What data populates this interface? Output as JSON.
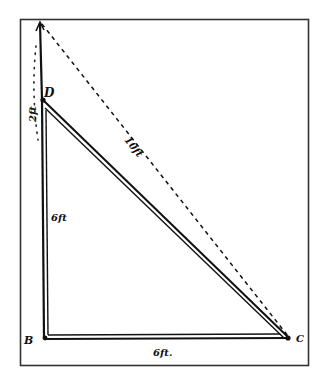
{
  "figure": {
    "type": "hand-drawn right triangle diagram",
    "colors": {
      "ink": "#111111",
      "frame": "#333333",
      "background": "#ffffff"
    },
    "vertices": {
      "top": {
        "label": ""
      },
      "D": {
        "label": "D"
      },
      "B": {
        "label": "B"
      },
      "C": {
        "label": "C"
      }
    },
    "labels": {
      "top_segment": "2ft",
      "vertical_side": "6ft",
      "bottom_side": "6ft.",
      "hypotenuse": "10ft"
    },
    "lines": {
      "vertical_BD": "double solid",
      "horizontal_BC": "double solid",
      "diagonal_DC": "double solid",
      "dashed_top_to_C": "dashed",
      "dotted_top_segment": "dotted"
    }
  }
}
